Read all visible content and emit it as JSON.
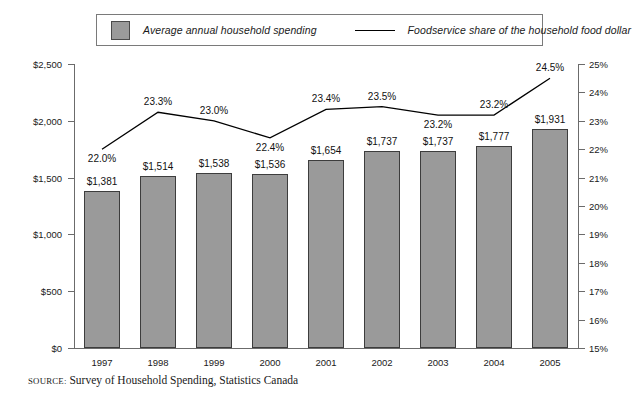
{
  "legend": {
    "bar_entry": "Average annual household spending",
    "line_entry": "Foodservice share of the household food dollar",
    "bar_swatch_icon": "gray-square-swatch",
    "line_swatch_icon": "horizontal-line-swatch",
    "bar_color": "#9a9a9a",
    "line_color": "#000000"
  },
  "source": {
    "kicker": "SOURCE:",
    "text": "Survey of Household Spending, Statistics Canada"
  },
  "chart_data": {
    "type": "bar",
    "title": "",
    "subtitle": "",
    "xlabel": "",
    "ylabel": "",
    "categories": [
      "1997",
      "1998",
      "1999",
      "2000",
      "2001",
      "2002",
      "2003",
      "2004",
      "2005"
    ],
    "grid": false,
    "legend_position": "top",
    "series": [
      {
        "name": "Average annual household spending",
        "type": "bar",
        "axis": "left",
        "color": "#9a9a9a",
        "values": [
          1381,
          1514,
          1538,
          1536,
          1654,
          1737,
          1737,
          1777,
          1931
        ],
        "labels": [
          "$1,381",
          "$1,514",
          "$1,538",
          "$1,536",
          "$1,654",
          "$1,737",
          "$1,737",
          "$1,777",
          "$1,931"
        ]
      },
      {
        "name": "Foodservice share of the household food dollar",
        "type": "line",
        "axis": "right",
        "color": "#000000",
        "values": [
          22.0,
          23.3,
          23.0,
          22.4,
          23.4,
          23.5,
          23.2,
          23.2,
          24.5
        ],
        "labels": [
          "22.0%",
          "23.3%",
          "23.0%",
          "22.4%",
          "23.4%",
          "23.5%",
          "23.2%",
          "23.2%",
          "24.5%"
        ],
        "label_placement": [
          "below",
          "above",
          "above",
          "below",
          "above",
          "above",
          "below",
          "above",
          "above"
        ]
      }
    ],
    "left_axis": {
      "ylim": [
        0,
        2500
      ],
      "tick_values": [
        0,
        500,
        1000,
        1500,
        2000,
        2500
      ],
      "tick_labels": [
        "$0",
        "$500",
        "$1,000",
        "$1,500",
        "$2,000",
        "$2,500"
      ]
    },
    "right_axis": {
      "ylim": [
        15,
        25
      ],
      "tick_values": [
        15,
        16,
        17,
        18,
        19,
        20,
        21,
        22,
        23,
        24,
        25
      ],
      "tick_labels": [
        "15%",
        "16%",
        "17%",
        "18%",
        "19%",
        "20%",
        "21%",
        "22%",
        "23%",
        "24%",
        "25%"
      ]
    }
  }
}
